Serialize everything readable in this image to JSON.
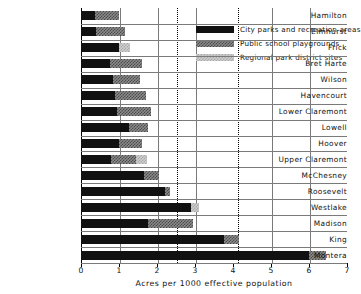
{
  "chart_data": {
    "type": "bar",
    "orientation": "horizontal",
    "stacked": true,
    "title": "",
    "xlabel": "Acres per 1000 effective population",
    "ylabel": "",
    "xlim": [
      0,
      7
    ],
    "xticks": [
      0,
      1,
      2,
      3,
      4,
      5,
      6,
      7
    ],
    "xticklabels": [
      "0",
      "1",
      "2",
      "3",
      "4",
      "5",
      "6",
      "7"
    ],
    "grid": true,
    "gridlines_solid": [
      1,
      2,
      3,
      5,
      6
    ],
    "gridlines_dashed": [
      2.5,
      4.1
    ],
    "legend_position": "top-right",
    "categories": [
      "Hamilton",
      "Elmhurst",
      "Frick",
      "Bret Harte",
      "Wilson",
      "Havencourt",
      "Lower Claremont",
      "Lowell",
      "Hoover",
      "Upper Claremont",
      "McChesney",
      "Roosevelt",
      "Westlake",
      "Madison",
      "King",
      "Montera"
    ],
    "series": [
      {
        "name": "City parks and recreation areas",
        "color": "#111111",
        "pattern": "solid",
        "values": [
          0.37,
          0.4,
          1.0,
          0.75,
          0.85,
          0.9,
          0.95,
          1.25,
          1.0,
          0.8,
          1.65,
          2.2,
          2.9,
          1.75,
          3.75,
          6.0
        ]
      },
      {
        "name": "Public school playgrounds",
        "color": "#8c8c8c",
        "pattern": "checkered-dark",
        "values": [
          0.63,
          0.75,
          0.0,
          0.85,
          0.7,
          0.8,
          0.9,
          0.5,
          0.6,
          0.65,
          0.4,
          0.15,
          0.0,
          1.2,
          0.4,
          0.45
        ]
      },
      {
        "name": "Regional park district sites",
        "color": "#cfcfcf",
        "pattern": "checkered-light",
        "values": [
          0.0,
          0.0,
          0.3,
          0.0,
          0.0,
          0.0,
          0.0,
          0.0,
          0.0,
          0.3,
          0.0,
          0.0,
          0.2,
          0.0,
          0.0,
          0.0
        ]
      }
    ]
  }
}
